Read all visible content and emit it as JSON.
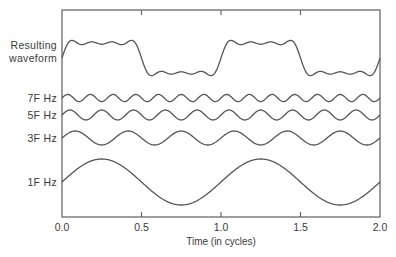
{
  "chart_data": {
    "type": "line",
    "title": "",
    "xlabel": "Time (in cycles)",
    "ylabel": "",
    "xlim": [
      0.0,
      2.0
    ],
    "x_ticks": [
      "0.0",
      "0.5",
      "1.0",
      "1.5",
      "2.0"
    ],
    "x_tick_values": [
      0.0,
      0.5,
      1.0,
      1.5,
      2.0
    ],
    "grid": false,
    "legend": "none",
    "series": [
      {
        "name": "Resulting waveform",
        "label_lines": [
          "Resulting",
          "waveform"
        ],
        "kind": "sum",
        "harmonics": [
          1,
          3,
          5,
          7
        ],
        "relative_amplitude": 1.0
      },
      {
        "name": "7F Hz",
        "label_lines": [
          "7F Hz"
        ],
        "kind": "sine",
        "harmonic": 7,
        "relative_amplitude": 0.143
      },
      {
        "name": "5F Hz",
        "label_lines": [
          "5F Hz"
        ],
        "kind": "sine",
        "harmonic": 5,
        "relative_amplitude": 0.2
      },
      {
        "name": "3F Hz",
        "label_lines": [
          "3F Hz"
        ],
        "kind": "sine",
        "harmonic": 3,
        "relative_amplitude": 0.333
      },
      {
        "name": "1F Hz",
        "label_lines": [
          "1F Hz"
        ],
        "kind": "sine",
        "harmonic": 1,
        "relative_amplitude": 1.0
      }
    ]
  },
  "colors": {
    "line": "#555555",
    "frame": "#6a6a6a",
    "text": "#3a3a3a"
  }
}
